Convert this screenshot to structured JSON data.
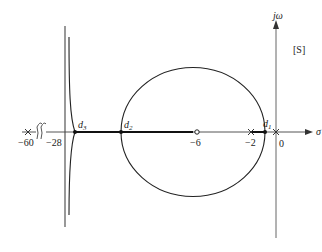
{
  "diagram": {
    "type": "root-locus",
    "plane_label": "[S]",
    "axes": {
      "real_axis_label": "σ",
      "imag_axis_label": "jω"
    },
    "poles": [
      {
        "value": -60,
        "label": "−60"
      },
      {
        "value": -2,
        "label": "−2"
      },
      {
        "value": 0,
        "label": "0"
      }
    ],
    "zeros": [
      {
        "value": -6,
        "label": "−6"
      }
    ],
    "tick_labels": [
      {
        "value": -28,
        "label": "−28"
      }
    ],
    "breakaway_points": [
      {
        "name": "d1",
        "label": "d",
        "sub": "1"
      },
      {
        "name": "d2",
        "label": "d",
        "sub": "2"
      },
      {
        "name": "d3",
        "label": "d",
        "sub": "3"
      }
    ],
    "axis_break_symbol": "//",
    "colors": {
      "locus": "#222222",
      "axis": "#555555",
      "background": "#ffffff"
    }
  }
}
